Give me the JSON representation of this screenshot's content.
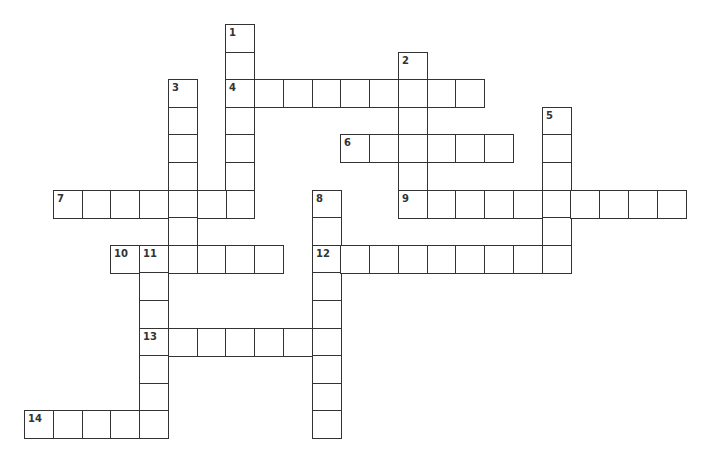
{
  "puzzle": {
    "origin": {
      "x": 24,
      "y": 24
    },
    "pitch": {
      "x": 28.75,
      "y": 27.6
    },
    "entries": [
      {
        "number": "1",
        "direction": "down",
        "col": 7,
        "row": 0,
        "length": 7
      },
      {
        "number": "2",
        "direction": "down",
        "col": 13,
        "row": 1,
        "length": 6
      },
      {
        "number": "3",
        "direction": "down",
        "col": 5,
        "row": 2,
        "length": 7
      },
      {
        "number": "4",
        "direction": "across",
        "col": 7,
        "row": 2,
        "length": 9
      },
      {
        "number": "5",
        "direction": "down",
        "col": 18,
        "row": 3,
        "length": 6
      },
      {
        "number": "6",
        "direction": "across",
        "col": 11,
        "row": 4,
        "length": 6
      },
      {
        "number": "7",
        "direction": "across",
        "col": 1,
        "row": 6,
        "length": 7
      },
      {
        "number": "8",
        "direction": "down",
        "col": 10,
        "row": 6,
        "length": 9
      },
      {
        "number": "9",
        "direction": "across",
        "col": 13,
        "row": 6,
        "length": 10
      },
      {
        "number": "10",
        "direction": "across",
        "col": 3,
        "row": 8,
        "length": 6
      },
      {
        "number": "11",
        "direction": "down",
        "col": 4,
        "row": 8,
        "length": 7
      },
      {
        "number": "12",
        "direction": "across",
        "col": 10,
        "row": 8,
        "length": 9
      },
      {
        "number": "13",
        "direction": "across",
        "col": 4,
        "row": 11,
        "length": 7
      },
      {
        "number": "14",
        "direction": "across",
        "col": 0,
        "row": 14,
        "length": 5
      }
    ]
  }
}
